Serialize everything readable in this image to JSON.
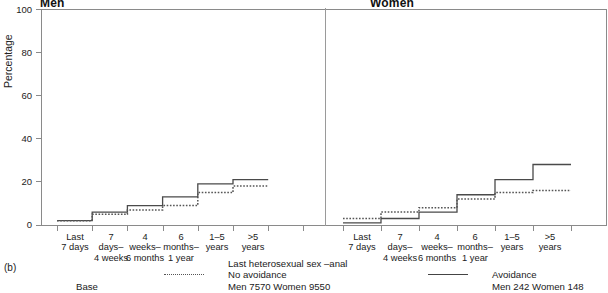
{
  "figure": {
    "fig_label": "(b)",
    "base_label": "Base"
  },
  "axis": {
    "ylabel": "Percentage",
    "yticks": [
      0,
      20,
      40,
      60,
      80,
      100
    ],
    "ylim": [
      0,
      100
    ]
  },
  "panels": {
    "left_title": "Men",
    "right_title": "Women"
  },
  "categories": [
    "Last\n7 days",
    "7\ndays–\n4 weeks",
    "4\nweeks–\n6 months",
    "6\nmonths–\n1 year",
    "1–5\nyears",
    ">5\nyears"
  ],
  "legend": {
    "title": "Last heterosexual sex –anal",
    "entries": [
      {
        "style": "dotted",
        "label": "No avoidance",
        "base": "Men 7570  Women 9550"
      },
      {
        "style": "solid",
        "label": "Avoidance",
        "base": "Men 242  Women 148"
      }
    ]
  },
  "colors": {
    "axis": "#8a8a8a",
    "solid_line": "#4a4a4a",
    "dotted_line": "#555555",
    "text": "#1a1a1a"
  },
  "chart_data": {
    "type": "line",
    "title": "Last heterosexual sex –anal",
    "xlabel": "",
    "ylabel": "Percentage",
    "ylim": [
      0,
      100
    ],
    "grid": false,
    "legend_position": "bottom",
    "panels": [
      {
        "name": "Men",
        "categories": [
          "Last 7 days",
          "7 days–4 weeks",
          "4 weeks–6 months",
          "6 months–1 year",
          "1–5 years",
          ">5 years"
        ],
        "series": [
          {
            "name": "Avoidance",
            "style": "solid",
            "values": [
              2,
              6,
              9,
              13,
              19,
              21
            ]
          },
          {
            "name": "No avoidance",
            "style": "dotted",
            "values": [
              2,
              5,
              7,
              9,
              15,
              18
            ]
          }
        ]
      },
      {
        "name": "Women",
        "categories": [
          "Last 7 days",
          "7 days–4 weeks",
          "4 weeks–6 months",
          "6 months–1 year",
          "1–5 years",
          ">5 years"
        ],
        "series": [
          {
            "name": "Avoidance",
            "style": "solid",
            "values": [
              1,
              3,
              6,
              14,
              21,
              28
            ]
          },
          {
            "name": "No avoidance",
            "style": "dotted",
            "values": [
              3,
              6,
              8,
              12,
              15,
              16
            ]
          }
        ]
      }
    ]
  }
}
